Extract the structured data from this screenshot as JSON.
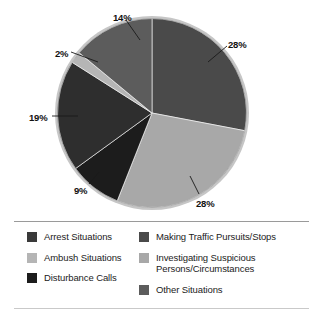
{
  "chart_data": {
    "type": "pie",
    "title": "",
    "subtitle": "",
    "xlabel": "",
    "ylabel": "",
    "grid": false,
    "legend_position": "bottom",
    "legend_columns": 2,
    "start_angle_deg": 0,
    "direction": "clockwise",
    "labels": [
      "Making Traffic Pursuits/Stops",
      "Investigating Suspicious Persons/Circumstances",
      "Disturbance Calls",
      "Arrest Situations",
      "Ambush Situations",
      "Other Situations"
    ],
    "values": [
      28,
      28,
      9,
      19,
      2,
      14
    ],
    "value_labels": [
      "28%",
      "28%",
      "9%",
      "19%",
      "2%",
      "14%"
    ],
    "colors": [
      "#4a4a4a",
      "#a8a8a8",
      "#1c1c1c",
      "#2e2e2e",
      "#b5b5b5",
      "#5c5c5c"
    ],
    "slices": [
      {
        "label": "Making Traffic Pursuits/Stops",
        "value": 28,
        "value_label": "28%",
        "color": "#4a4a4a",
        "start_deg": 0,
        "end_deg": 100.8
      },
      {
        "label": "Investigating Suspicious Persons/Circumstances",
        "value": 28,
        "value_label": "28%",
        "color": "#a8a8a8",
        "start_deg": 100.8,
        "end_deg": 201.6
      },
      {
        "label": "Disturbance Calls",
        "value": 9,
        "value_label": "9%",
        "color": "#1c1c1c",
        "start_deg": 201.6,
        "end_deg": 234.0
      },
      {
        "label": "Arrest Situations",
        "value": 19,
        "value_label": "19%",
        "color": "#2e2e2e",
        "start_deg": 234.0,
        "end_deg": 302.4
      },
      {
        "label": "Ambush Situations",
        "value": 2,
        "value_label": "2%",
        "color": "#b5b5b5",
        "start_deg": 302.4,
        "end_deg": 309.6
      },
      {
        "label": "Other Situations",
        "value": 14,
        "value_label": "14%",
        "color": "#5c5c5c",
        "start_deg": 309.6,
        "end_deg": 360.0
      }
    ]
  },
  "callouts": [
    {
      "text": "14%",
      "x": 113,
      "y": 13
    },
    {
      "text": "28%",
      "x": 228,
      "y": 40
    },
    {
      "text": "2%",
      "x": 55,
      "y": 49
    },
    {
      "text": "19%",
      "x": 29,
      "y": 113
    },
    {
      "text": "9%",
      "x": 74,
      "y": 186
    },
    {
      "text": "28%",
      "x": 196,
      "y": 199
    }
  ],
  "legend": {
    "columns": [
      {
        "items": [
          {
            "label": "Arrest Situations",
            "color": "#3a3a3a"
          },
          {
            "label": "Ambush Situations",
            "color": "#b5b5b5"
          },
          {
            "label": "Disturbance Calls",
            "color": "#1c1c1c"
          }
        ]
      },
      {
        "items": [
          {
            "label": "Making Traffic Pursuits/Stops",
            "color": "#4a4a4a"
          },
          {
            "label": "Investigating Suspicious Persons/Circumstances",
            "color": "#a8a8a8"
          },
          {
            "label": "Other Situations",
            "color": "#5c5c5c"
          }
        ]
      }
    ]
  }
}
